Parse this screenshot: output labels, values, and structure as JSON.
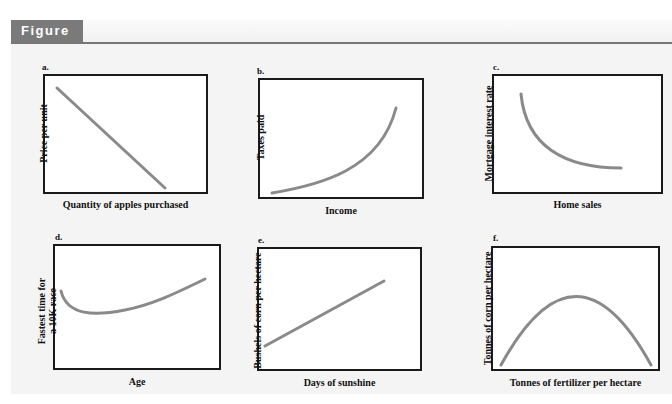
{
  "figure": {
    "title": "Figure 1"
  },
  "panels": [
    {
      "letter": "a.",
      "xlabel": "Quantity of apples purchased",
      "ylabel": "Price per unit",
      "shape": "linear-decreasing"
    },
    {
      "letter": "b.",
      "xlabel": "Income",
      "ylabel": "Taxes paid",
      "shape": "convex-increasing"
    },
    {
      "letter": "c.",
      "xlabel": "Home sales",
      "ylabel": "Mortgage interest rate",
      "shape": "convex-decreasing"
    },
    {
      "letter": "d.",
      "xlabel": "Age",
      "ylabel_line1": "Fastest time for",
      "ylabel_line2": "a 10K race",
      "shape": "u-shaped"
    },
    {
      "letter": "e.",
      "xlabel": "Days of sunshine",
      "ylabel": "Bushels of corn per hectare",
      "shape": "linear-increasing"
    },
    {
      "letter": "f.",
      "xlabel": "Tonnes of fertilizer per hectare",
      "ylabel": "Tonnes of corn per hectare",
      "shape": "inverted-u"
    }
  ],
  "colors": {
    "header_tab": "#7a7a7a",
    "curve": "#8a8a8a",
    "axis": "#1a1a1a",
    "background": "#f4f4f4"
  }
}
